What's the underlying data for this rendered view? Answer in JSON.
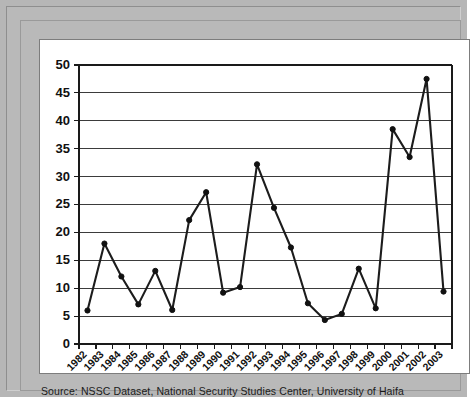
{
  "source": {
    "text": "Source: NSSC Dataset, National Security Studies Center, University of Haifa"
  },
  "colors": {
    "frame": "#b9b9b9",
    "canvas": "#ffffff",
    "line": "#1c1c1c",
    "marker": "#111111",
    "grid": "#3b3b3b",
    "axis": "#1a1a1a"
  },
  "chart_data": {
    "type": "line",
    "title": "",
    "subtitle": "",
    "xlabel": "",
    "ylabel": "",
    "categories": [
      "1982",
      "1983",
      "1984",
      "1985",
      "1986",
      "1987",
      "1988",
      "1989",
      "1990",
      "1991",
      "1992",
      "1993",
      "1994",
      "1995",
      "1996",
      "1997",
      "1998",
      "1999",
      "2000",
      "2001",
      "2002",
      "2003"
    ],
    "values": [
      6.0,
      18.0,
      12.1,
      7.1,
      13.1,
      6.1,
      22.2,
      27.2,
      9.2,
      10.2,
      32.2,
      24.4,
      17.3,
      7.3,
      4.3,
      5.4,
      13.5,
      6.4,
      38.5,
      33.5,
      47.5,
      9.4
    ],
    "series": [
      {
        "name": "",
        "values": [
          6.0,
          18.0,
          12.1,
          7.1,
          13.1,
          6.1,
          22.2,
          27.2,
          9.2,
          10.2,
          32.2,
          24.4,
          17.3,
          7.3,
          4.3,
          5.4,
          13.5,
          6.4,
          38.5,
          33.5,
          47.5,
          9.4
        ]
      }
    ],
    "ylim": [
      0,
      50
    ],
    "yticks": [
      0,
      5,
      10,
      15,
      20,
      25,
      30,
      35,
      40,
      45,
      50
    ],
    "ytick_labels": [
      "0",
      "5",
      "10",
      "15",
      "20",
      "25",
      "30",
      "35",
      "40",
      "45",
      "50"
    ],
    "grid": true,
    "grid_axis": "y",
    "legend": false,
    "legend_position": "none",
    "markers": true,
    "marker_style": "circle",
    "xtick_rotation": 45
  }
}
